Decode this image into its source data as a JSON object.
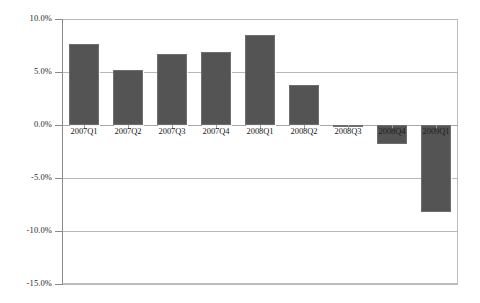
{
  "chart_data": {
    "type": "bar",
    "title": "",
    "subtitle": "",
    "xlabel": "",
    "ylabel": "",
    "categories": [
      "2007Q1",
      "2007Q2",
      "2007Q3",
      "2007Q4",
      "2008Q1",
      "2008Q2",
      "2008Q3",
      "2008Q4",
      "2009Q1"
    ],
    "values": [
      7.6,
      5.2,
      6.7,
      6.9,
      8.5,
      3.8,
      -0.2,
      -1.8,
      -8.2
    ],
    "series": [
      {
        "name": "",
        "values": [
          7.6,
          5.2,
          6.7,
          6.9,
          8.5,
          3.8,
          -0.2,
          -1.8,
          -8.2
        ]
      }
    ],
    "ylim": [
      -15.0,
      10.0
    ],
    "ytick_values": [
      10.0,
      5.0,
      0.0,
      -5.0,
      -10.0,
      -15.0
    ],
    "ytick_labels": [
      "10.0%",
      "5.0%",
      "0.0%",
      "-5.0%",
      "-10.0%",
      "-15.0%"
    ],
    "grid": true,
    "grid_axis": "y",
    "legend": false,
    "legend_position": "none",
    "annotations": [],
    "bar_color": "#545454",
    "grid_color": "#b9b9b9",
    "axis_color": "#8a8a8a",
    "background_color": "#ffffff",
    "value_format": "percent"
  }
}
